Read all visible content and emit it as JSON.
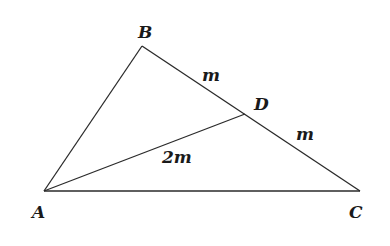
{
  "diagram": {
    "type": "triangle",
    "points": {
      "A": {
        "label": "A",
        "x": 44,
        "y": 191
      },
      "B": {
        "label": "B",
        "x": 142,
        "y": 46
      },
      "C": {
        "label": "C",
        "x": 360,
        "y": 191
      },
      "D": {
        "label": "D",
        "x": 245,
        "y": 114
      }
    },
    "segments": [
      {
        "from": "A",
        "to": "B"
      },
      {
        "from": "B",
        "to": "C"
      },
      {
        "from": "A",
        "to": "C"
      },
      {
        "from": "A",
        "to": "D"
      }
    ],
    "segment_labels": {
      "BD": "m",
      "DC": "m",
      "AD": "2m"
    },
    "colors": {
      "stroke": "#2a2a2a",
      "text": "#1a1a1a",
      "background": "#ffffff"
    }
  }
}
